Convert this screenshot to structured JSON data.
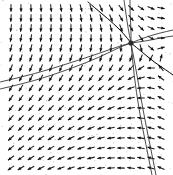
{
  "figure": {
    "kind": "direction-field",
    "title": "",
    "background_color": "#ffffff",
    "ink_color": "#111111",
    "width_px": 173,
    "height_px": 175,
    "caption": ""
  },
  "chart_data": {
    "type": "scatter",
    "title": "",
    "subtitle": "",
    "xlabel": "",
    "ylabel": "",
    "xlim": [
      0,
      173
    ],
    "ylim": [
      0,
      175
    ],
    "grid": false,
    "legend": "none",
    "axis_visible": false,
    "tick_labels_x": [],
    "tick_labels_y": [],
    "critical_points": [
      {
        "name": "saddle",
        "x_px": 131,
        "y_px": 43,
        "classification": "saddle"
      }
    ],
    "grid_spacing_px": 10,
    "grid_origin_px": [
      11,
      8
    ],
    "grid_cols": 16,
    "grid_rows": 17,
    "arrow_length_px": 7.5,
    "arrow_head_px": 3.4,
    "field_model": {
      "note": "Arrow direction at lattice point (x,y) measured from the screenshot; angle in degrees measured clockwise from screen-up (0 = up, 90 = right, 180 = down, 270 = left).",
      "center_px": [
        131,
        43
      ],
      "quadrant_angles": {
        "upper_left_far": 8,
        "upper_left_near_separatrix": 72,
        "upper_right": 318,
        "right_of_center": 300,
        "lower_left_upper": 118,
        "lower_left_lower": 152,
        "lower_middle": 168,
        "lower_right": 183,
        "far_right_low": 190
      }
    },
    "trajectories": [
      {
        "name": "separatrix-incoming-upper-left",
        "style": "single",
        "points_px": [
          [
            88,
            2
          ],
          [
            101,
            13
          ],
          [
            114,
            24
          ],
          [
            124,
            34
          ],
          [
            131,
            43
          ]
        ]
      },
      {
        "name": "separatrix-outgoing-lower-right",
        "style": "single",
        "points_px": [
          [
            131,
            43
          ],
          [
            142,
            52
          ],
          [
            154,
            62
          ],
          [
            166,
            70
          ],
          [
            173,
            75
          ]
        ]
      },
      {
        "name": "separatrix-incoming-lower-left-pair-a",
        "style": "pair",
        "points_px": [
          [
            0,
            82
          ],
          [
            34,
            74
          ],
          [
            70,
            63
          ],
          [
            100,
            53
          ],
          [
            120,
            46
          ],
          [
            131,
            43
          ]
        ]
      },
      {
        "name": "separatrix-incoming-lower-left-pair-b",
        "style": "pair",
        "points_px": [
          [
            0,
            89
          ],
          [
            34,
            81
          ],
          [
            70,
            69
          ],
          [
            100,
            57
          ],
          [
            120,
            47
          ],
          [
            131,
            43
          ]
        ]
      },
      {
        "name": "separatrix-outgoing-right-pair-a",
        "style": "pair",
        "points_px": [
          [
            131,
            43
          ],
          [
            146,
            37
          ],
          [
            160,
            33
          ],
          [
            173,
            30
          ]
        ]
      },
      {
        "name": "separatrix-outgoing-right-pair-b",
        "style": "pair",
        "points_px": [
          [
            131,
            43
          ],
          [
            146,
            41
          ],
          [
            160,
            38
          ],
          [
            173,
            36
          ]
        ]
      },
      {
        "name": "separatrix-vertical-up-pair-a",
        "style": "pair",
        "points_px": [
          [
            124,
            0
          ],
          [
            126,
            14
          ],
          [
            128,
            28
          ],
          [
            131,
            43
          ]
        ]
      },
      {
        "name": "separatrix-vertical-up-pair-b",
        "style": "pair",
        "points_px": [
          [
            130,
            0
          ],
          [
            130,
            14
          ],
          [
            131,
            28
          ],
          [
            131,
            43
          ]
        ]
      },
      {
        "name": "separatrix-vertical-down-pair-a",
        "style": "pair",
        "points_px": [
          [
            131,
            43
          ],
          [
            134,
            75
          ],
          [
            139,
            110
          ],
          [
            146,
            145
          ],
          [
            152,
            175
          ]
        ]
      },
      {
        "name": "separatrix-vertical-down-pair-b",
        "style": "pair",
        "points_px": [
          [
            131,
            43
          ],
          [
            137,
            75
          ],
          [
            143,
            110
          ],
          [
            150,
            145
          ],
          [
            156,
            175
          ]
        ]
      }
    ]
  }
}
